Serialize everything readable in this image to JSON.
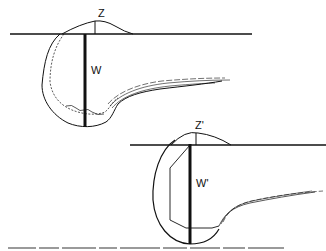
{
  "figure": {
    "top_diagram": {
      "label_height": "Z",
      "label_width": "W"
    },
    "bottom_diagram": {
      "label_height": "Z'",
      "label_width": "W'"
    },
    "caption_cropped": true
  },
  "colors": {
    "stroke": "#111111",
    "background": "#ffffff"
  }
}
